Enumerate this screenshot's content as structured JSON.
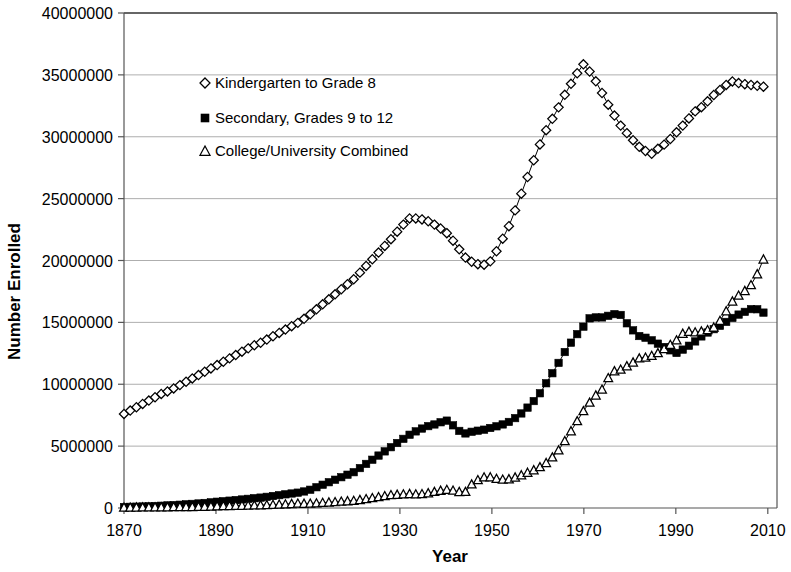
{
  "chart_data": {
    "type": "line",
    "title": "",
    "xlabel": "Year",
    "ylabel": "Number Enrolled",
    "xlim": [
      1870,
      2012
    ],
    "ylim": [
      0,
      40000000
    ],
    "xticks": [
      1870,
      1890,
      1910,
      1930,
      1950,
      1970,
      1990,
      2010
    ],
    "yticks": [
      0,
      5000000,
      10000000,
      15000000,
      20000000,
      25000000,
      30000000,
      35000000,
      40000000
    ],
    "ytick_labels": [
      "0",
      "5000000",
      "10000000",
      "15000000",
      "20000000",
      "25000000",
      "30000000",
      "35000000",
      "40000000"
    ],
    "xtick_labels": [
      "1870",
      "1890",
      "1910",
      "1930",
      "1950",
      "1970",
      "1990",
      "2010"
    ],
    "grid": "horizontal",
    "legend_position": "upper-left-inside",
    "series": [
      {
        "name": "Kindergarten to Grade 8",
        "marker": "diamond-hollow",
        "color": "#000000",
        "x": [
          1870,
          1872,
          1874,
          1876,
          1878,
          1880,
          1882,
          1884,
          1886,
          1888,
          1890,
          1892,
          1894,
          1896,
          1898,
          1900,
          1902,
          1904,
          1906,
          1908,
          1910,
          1912,
          1914,
          1916,
          1918,
          1920,
          1922,
          1924,
          1926,
          1928,
          1930,
          1932,
          1934,
          1936,
          1938,
          1940,
          1942,
          1944,
          1946,
          1948,
          1950,
          1952,
          1954,
          1956,
          1958,
          1960,
          1962,
          1964,
          1966,
          1968,
          1969,
          1970,
          1972,
          1974,
          1976,
          1978,
          1980,
          1982,
          1984,
          1985,
          1986,
          1988,
          1990,
          1992,
          1994,
          1996,
          1998,
          2000,
          2002,
          2004,
          2006,
          2008,
          2010
        ],
        "values": [
          7600000,
          8000000,
          8400000,
          8800000,
          9200000,
          9500000,
          9900000,
          10300000,
          10700000,
          11100000,
          11500000,
          11900000,
          12300000,
          12700000,
          13100000,
          13400000,
          13800000,
          14200000,
          14600000,
          15000000,
          15500000,
          16100000,
          16700000,
          17300000,
          17900000,
          18500000,
          19300000,
          20100000,
          20900000,
          21700000,
          22600000,
          23400000,
          23400000,
          23200000,
          22800000,
          22300000,
          21400000,
          20300000,
          19800000,
          19600000,
          20000000,
          21500000,
          23000000,
          25000000,
          27000000,
          29000000,
          30700000,
          32000000,
          33500000,
          34800000,
          35400000,
          35900000,
          34900000,
          33500000,
          32100000,
          30900000,
          30000000,
          29200000,
          28700000,
          28600000,
          29000000,
          29500000,
          30300000,
          31100000,
          32000000,
          32500000,
          33300000,
          33900000,
          34500000,
          34300000,
          34200000,
          34100000,
          34000000
        ]
      },
      {
        "name": "Secondary, Grades 9 to 12",
        "marker": "square-filled",
        "color": "#000000",
        "x": [
          1870,
          1872,
          1874,
          1876,
          1878,
          1880,
          1882,
          1884,
          1886,
          1888,
          1890,
          1892,
          1894,
          1896,
          1898,
          1900,
          1902,
          1904,
          1906,
          1908,
          1910,
          1912,
          1914,
          1916,
          1918,
          1920,
          1922,
          1924,
          1926,
          1928,
          1930,
          1932,
          1934,
          1936,
          1938,
          1940,
          1941,
          1942,
          1943,
          1944,
          1946,
          1948,
          1950,
          1952,
          1954,
          1956,
          1958,
          1960,
          1962,
          1964,
          1966,
          1968,
          1970,
          1971,
          1972,
          1974,
          1976,
          1977,
          1978,
          1980,
          1982,
          1984,
          1986,
          1988,
          1990,
          1992,
          1994,
          1996,
          1998,
          2000,
          2002,
          2004,
          2006,
          2007,
          2008,
          2010
        ],
        "values": [
          80000,
          100000,
          120000,
          150000,
          180000,
          220000,
          260000,
          310000,
          360000,
          420000,
          500000,
          560000,
          630000,
          700000,
          780000,
          850000,
          950000,
          1050000,
          1150000,
          1250000,
          1400000,
          1700000,
          2000000,
          2300000,
          2600000,
          2900000,
          3400000,
          3900000,
          4400000,
          4900000,
          5400000,
          5900000,
          6300000,
          6600000,
          6800000,
          7100000,
          6900000,
          6500000,
          6200000,
          6000000,
          6200000,
          6300000,
          6500000,
          6700000,
          7000000,
          7500000,
          8200000,
          9000000,
          10200000,
          11400000,
          12700000,
          13800000,
          14700000,
          15300000,
          15400000,
          15400000,
          15600000,
          15700000,
          15600000,
          14600000,
          13900000,
          13700000,
          13300000,
          12900000,
          12500000,
          12900000,
          13400000,
          14000000,
          14400000,
          14800000,
          15300000,
          15700000,
          16000000,
          16200000,
          16000000,
          15600000
        ]
      },
      {
        "name": "College/University Combined",
        "marker": "triangle-hollow",
        "color": "#000000",
        "x": [
          1870,
          1872,
          1874,
          1876,
          1878,
          1880,
          1882,
          1884,
          1886,
          1888,
          1890,
          1892,
          1894,
          1896,
          1898,
          1900,
          1902,
          1904,
          1906,
          1908,
          1910,
          1912,
          1914,
          1916,
          1918,
          1920,
          1922,
          1924,
          1926,
          1928,
          1930,
          1932,
          1934,
          1936,
          1938,
          1940,
          1942,
          1944,
          1946,
          1948,
          1949,
          1950,
          1952,
          1954,
          1956,
          1958,
          1960,
          1962,
          1964,
          1966,
          1968,
          1970,
          1972,
          1974,
          1976,
          1978,
          1980,
          1982,
          1984,
          1986,
          1988,
          1990,
          1992,
          1994,
          1996,
          1998,
          2000,
          2002,
          2004,
          2006,
          2008,
          2010
        ],
        "values": [
          50000,
          55000,
          60000,
          66000,
          72000,
          80000,
          88000,
          96000,
          105000,
          115000,
          157000,
          170000,
          185000,
          200000,
          220000,
          238000,
          265000,
          295000,
          330000,
          370000,
          355000,
          400000,
          450000,
          500000,
          550000,
          598000,
          700000,
          820000,
          940000,
          1060000,
          1100000,
          1150000,
          1100000,
          1200000,
          1350000,
          1494000,
          1400000,
          1200000,
          2100000,
          2450000,
          2600000,
          2444000,
          2300000,
          2350000,
          2600000,
          2900000,
          3200000,
          3700000,
          4400000,
          5500000,
          6700000,
          7900000,
          8900000,
          9600000,
          11000000,
          11200000,
          11600000,
          12100000,
          12200000,
          12500000,
          13000000,
          13500000,
          14300000,
          14200000,
          14300000,
          14500000,
          15300000,
          16600000,
          17300000,
          17800000,
          19100000,
          21000000
        ]
      }
    ]
  },
  "legend": {
    "entries": [
      {
        "label": "Kindergarten to Grade 8",
        "marker": "diamond-hollow"
      },
      {
        "label": "Secondary, Grades 9 to 12",
        "marker": "square-filled"
      },
      {
        "label": "College/University Combined",
        "marker": "triangle-hollow"
      }
    ]
  }
}
